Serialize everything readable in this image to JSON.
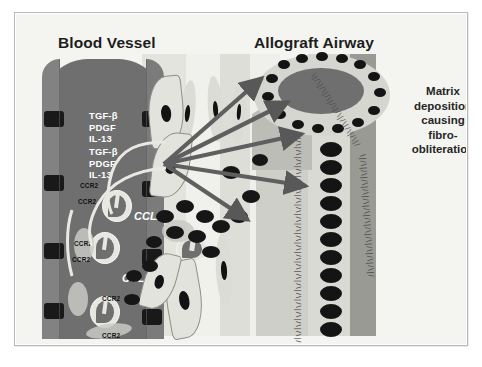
{
  "figure": {
    "titles": {
      "left": "Blood Vessel",
      "right": "Allograft Airway"
    },
    "caption": {
      "line1": "Matrix",
      "line2": "deposition",
      "line3": "causing",
      "line4": "fibro-",
      "line5": "obliteration",
      "full_text": "Matrix deposition causing fibro-obliteration"
    },
    "cytokine_blocks": [
      {
        "lines": [
          "TGF-β",
          "PDGF",
          "IL-13"
        ]
      },
      {
        "lines": [
          "TGF-β",
          "PDGF",
          "IL-13"
        ]
      }
    ],
    "chemokine_labels": [
      "CCL2",
      "CCL2"
    ],
    "receptor_labels": [
      "CCR2",
      "CCR2",
      "CCR2",
      "CCR2",
      "CCR2",
      "CCR2"
    ],
    "colors": {
      "vessel": "#6f6f6f",
      "vessel_wall": "#828282",
      "nucleus": "#141414",
      "arrow": "#5f5f5f",
      "tissue_light": "#f2f2ef",
      "tissue_mid": "#d9d9d3",
      "frame": "#b9b9b9",
      "label_white": "#ffffff",
      "text_dark": "#1d1d1d"
    },
    "elements": {
      "vessel_label": "blood-vessel-lumen",
      "airway_label": "allograft-airway-lumen",
      "arrow_count": 5,
      "monocyte_count": 4
    }
  }
}
